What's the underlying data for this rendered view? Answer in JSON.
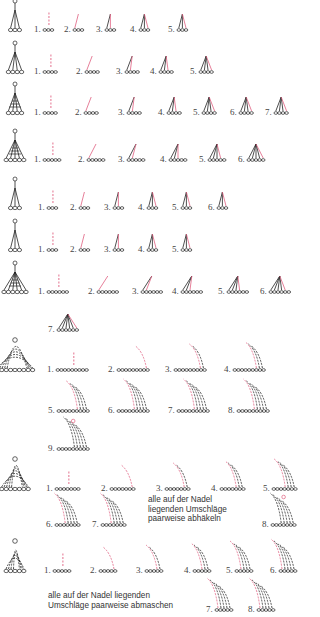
{
  "figure": {
    "title_partial": "",
    "accent_color": "#e06080",
    "line_color": "#222222"
  },
  "rows": [
    {
      "id": "row1",
      "y": 30,
      "chains": 3,
      "height": "tr",
      "steps": [
        "1.",
        "2.",
        "3.",
        "4.",
        "5."
      ],
      "step_x": [
        34,
        64,
        96,
        130,
        168
      ]
    },
    {
      "id": "row2",
      "y": 72,
      "chains": 4,
      "height": "tr",
      "steps": [
        "1.",
        "2.",
        "3.",
        "4.",
        "5."
      ],
      "step_x": [
        34,
        76,
        116,
        150,
        190
      ]
    },
    {
      "id": "row3",
      "y": 113,
      "chains": 4,
      "height": "dtr-cluster",
      "steps": [
        "1.",
        "2.",
        "3.",
        "4.",
        "5.",
        "6.",
        "7."
      ],
      "step_x": [
        34,
        75,
        118,
        158,
        193,
        230,
        265
      ]
    },
    {
      "id": "row4",
      "y": 160,
      "chains": 5,
      "height": "tr-cluster",
      "steps": [
        "1.",
        "2.",
        "3.",
        "4.",
        "5.",
        "6."
      ],
      "step_x": [
        34,
        78,
        118,
        160,
        199,
        238
      ]
    },
    {
      "id": "row5",
      "y": 208,
      "chains": 3,
      "height": "trtr",
      "steps": [
        "1.",
        "2.",
        "3.",
        "4.",
        "5.",
        "6."
      ],
      "step_x": [
        38,
        70,
        104,
        138,
        172,
        208
      ]
    },
    {
      "id": "row6",
      "y": 250,
      "chains": 3,
      "height": "dtr",
      "steps": [
        "1.",
        "2.",
        "3.",
        "4.",
        "5."
      ],
      "step_x": [
        38,
        70,
        104,
        138,
        172
      ]
    },
    {
      "id": "row7",
      "y": 292,
      "chains": 6,
      "height": "trtr-cluster",
      "steps": [
        "1.",
        "2.",
        "3.",
        "4.",
        "5.",
        "6."
      ],
      "step_x": [
        38,
        88,
        132,
        172,
        218,
        260
      ]
    },
    {
      "id": "row7b",
      "y": 330,
      "chains": 6,
      "height": "trtr-cluster",
      "steps": [
        "7."
      ],
      "step_x": [
        48
      ]
    },
    {
      "id": "row8",
      "y": 370,
      "chains": 9,
      "height": "shell",
      "steps": [
        "1.",
        "2.",
        "3.",
        "4."
      ],
      "step_x": [
        47,
        108,
        165,
        224
      ]
    },
    {
      "id": "row8b",
      "y": 411,
      "chains": 9,
      "height": "shell",
      "steps": [
        "5.",
        "6.",
        "7.",
        "8."
      ],
      "step_x": [
        48,
        108,
        168,
        228
      ]
    },
    {
      "id": "row8c",
      "y": 449,
      "chains": 9,
      "height": "shell",
      "steps": [
        "9."
      ],
      "step_x": [
        48
      ]
    },
    {
      "id": "row9",
      "y": 489,
      "chains": 7,
      "height": "fan",
      "steps": [
        "1.",
        "2.",
        "3.",
        "4.",
        "5."
      ],
      "step_x": [
        46,
        101,
        156,
        211,
        263
      ]
    },
    {
      "id": "row9b",
      "y": 525,
      "chains": 7,
      "height": "fan",
      "steps": [
        "6.",
        "7."
      ],
      "step_x": [
        46,
        92
      ],
      "extra_step": {
        "label": "8.",
        "x": 262
      }
    },
    {
      "id": "row10",
      "y": 571,
      "chains": 5,
      "height": "fan-small",
      "steps": [
        "1.",
        "2.",
        "3.",
        "4.",
        "5.",
        "6."
      ],
      "step_x": [
        44,
        90,
        136,
        184,
        226,
        270
      ]
    },
    {
      "id": "row10b",
      "y": 610,
      "chains": 5,
      "height": "fan-small",
      "steps": [
        "7.",
        "8."
      ],
      "step_x": [
        206,
        248
      ]
    }
  ],
  "notes": [
    {
      "id": "note-abhaekeln",
      "text": "alle auf der Nadel\nliegenden Umschläge\npaarweise abhäkeln",
      "x": 148,
      "y": 495
    },
    {
      "id": "note-abmaschen",
      "text": "alle auf der Nadel liegenden\nUmschläge paarweise abmaschen",
      "x": 48,
      "y": 591
    }
  ]
}
